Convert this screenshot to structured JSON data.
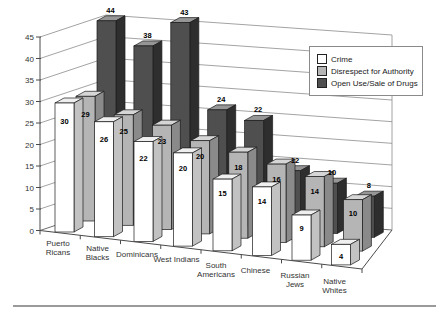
{
  "chart_data": {
    "type": "bar",
    "projection": "3d-column",
    "title": "",
    "categories": [
      "Puerto Ricans",
      "Native Blacks",
      "Dominicans",
      "West Indians",
      "South Americans",
      "Chinese",
      "Russian Jews",
      "Native Whites"
    ],
    "category_label_lines": [
      [
        "Puerto",
        "Ricans"
      ],
      [
        "Native",
        "Blacks"
      ],
      [
        "Dominicans"
      ],
      [
        "West Indians"
      ],
      [
        "South",
        "Americans"
      ],
      [
        "Chinese"
      ],
      [
        "Russian",
        "Jews"
      ],
      [
        "Native",
        "Whites"
      ]
    ],
    "series": [
      {
        "name": "Crime",
        "values": [
          30,
          26,
          22,
          20,
          15,
          14,
          9,
          4
        ],
        "color": "#ffffff",
        "top_color": "#efefef",
        "side_color": "#c2c2c2"
      },
      {
        "name": "Disrespect for Authority",
        "values": [
          29,
          25,
          23,
          20,
          18,
          16,
          14,
          10
        ],
        "color": "#b5b5b5",
        "top_color": "#d6d6d6",
        "side_color": "#8a8a8a"
      },
      {
        "name": "Open Use/Sale of Drugs",
        "values": [
          44,
          38,
          43,
          24,
          22,
          12,
          10,
          8
        ],
        "color": "#4f4f4f",
        "top_color": "#969696",
        "side_color": "#2e2e2e"
      }
    ],
    "yaxis": {
      "min": 0,
      "max": 45,
      "step": 5,
      "ticks": [
        0,
        5,
        10,
        15,
        20,
        25,
        30,
        35,
        40,
        45
      ]
    },
    "legend": {
      "position": "top-right"
    },
    "grid": true,
    "data_labels": true,
    "colors": {
      "grid_line": "#8c8c8c",
      "axis_line": "#4a4a4a",
      "bar_outline": "#1a1a1a",
      "label_text": "#000000",
      "axis_text": "#333333"
    }
  }
}
